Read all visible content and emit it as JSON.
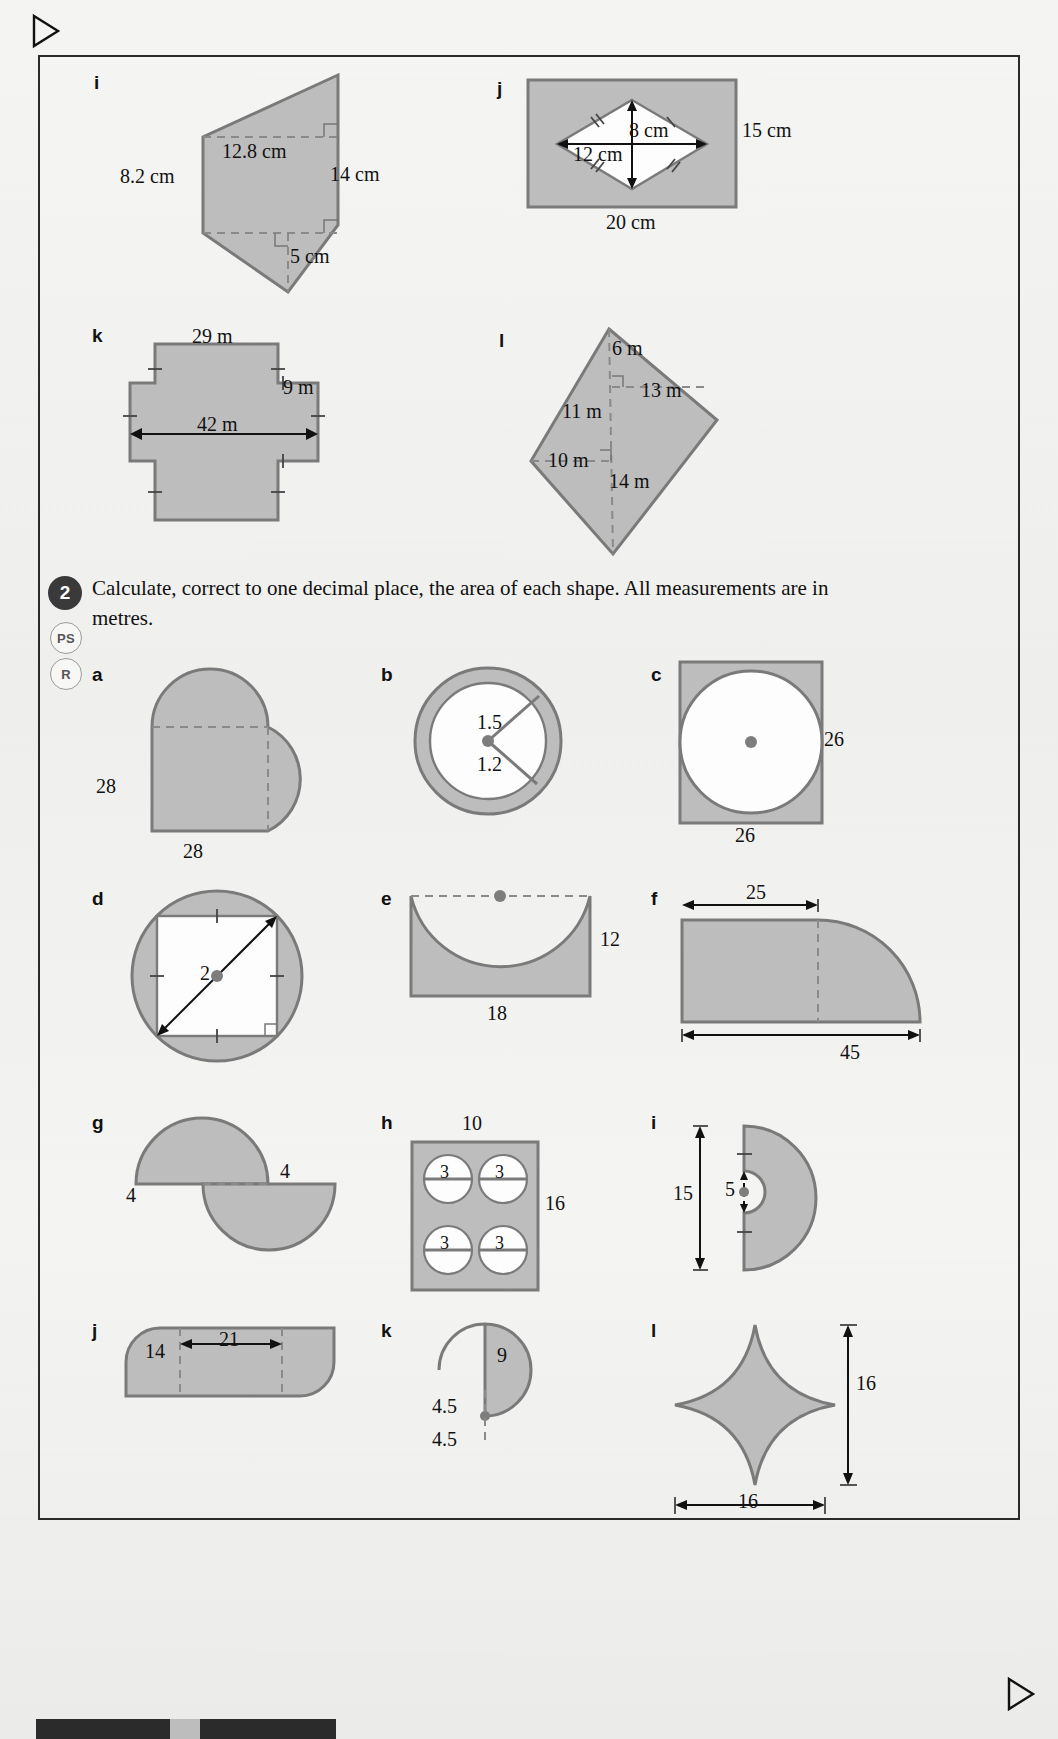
{
  "page": {
    "nav_prev_icon": "triangle-left-icon",
    "nav_next_icon": "triangle-right-icon"
  },
  "question1_shapes": [
    {
      "id": "i",
      "label": "i",
      "type": "trapezium-composite",
      "dims": [
        "12.8 cm",
        "8.2 cm",
        "14 cm",
        "5 cm"
      ]
    },
    {
      "id": "j",
      "label": "j",
      "type": "rectangle-with-kite-hole",
      "dims": [
        "8 cm",
        "12 cm",
        "15 cm",
        "20 cm"
      ]
    },
    {
      "id": "k",
      "label": "k",
      "type": "cross-polygon",
      "dims": [
        "29 m",
        "9 m",
        "42 m"
      ]
    },
    {
      "id": "l",
      "label": "l",
      "type": "rotated-quadrilateral",
      "dims": [
        "6 m",
        "13 m",
        "11 m",
        "10 m",
        "14 m"
      ]
    }
  ],
  "question2": {
    "number": "2",
    "text": "Calculate, correct to one decimal place, the area of each shape. All measurements are in metres.",
    "badges": [
      "PS",
      "R"
    ],
    "shapes": [
      {
        "id": "a",
        "label": "a",
        "type": "heart-two-semicircles",
        "dims": [
          "28",
          "28"
        ]
      },
      {
        "id": "b",
        "label": "b",
        "type": "annulus",
        "dims": [
          "1.5",
          "1.2"
        ]
      },
      {
        "id": "c",
        "label": "c",
        "type": "square-with-circle-hole",
        "dims": [
          "26",
          "26"
        ]
      },
      {
        "id": "d",
        "label": "d",
        "type": "circle-with-square-hole",
        "dims": [
          "2"
        ]
      },
      {
        "id": "e",
        "label": "e",
        "type": "rectangle-minus-semicircle",
        "dims": [
          "12",
          "18"
        ]
      },
      {
        "id": "f",
        "label": "f",
        "type": "rectangle-quarter-circle",
        "dims": [
          "25",
          "45"
        ]
      },
      {
        "id": "g",
        "label": "g",
        "type": "two-半circles-offset",
        "dims": [
          "4",
          "4"
        ]
      },
      {
        "id": "h",
        "label": "h",
        "type": "rectangle-four-circle-holes",
        "dims": [
          "10",
          "16",
          "3",
          "3",
          "3",
          "3"
        ]
      },
      {
        "id": "i",
        "label": "i",
        "type": "semicircle-with-semicircle-hole",
        "dims": [
          "15",
          "5"
        ]
      },
      {
        "id": "j",
        "label": "j",
        "type": "parallelogram-rounded",
        "dims": [
          "14",
          "21"
        ]
      },
      {
        "id": "k",
        "label": "k",
        "type": "spiral-quartercircles",
        "dims": [
          "9",
          "4.5",
          "4.5"
        ]
      },
      {
        "id": "l",
        "label": "l",
        "type": "astroid-star",
        "dims": [
          "16",
          "16"
        ]
      }
    ]
  },
  "colors": {
    "shape_fill": "#bdbdbd",
    "shape_stroke": "#808080",
    "page_bg": "#f2f2f0",
    "text": "#1a1a1a"
  }
}
